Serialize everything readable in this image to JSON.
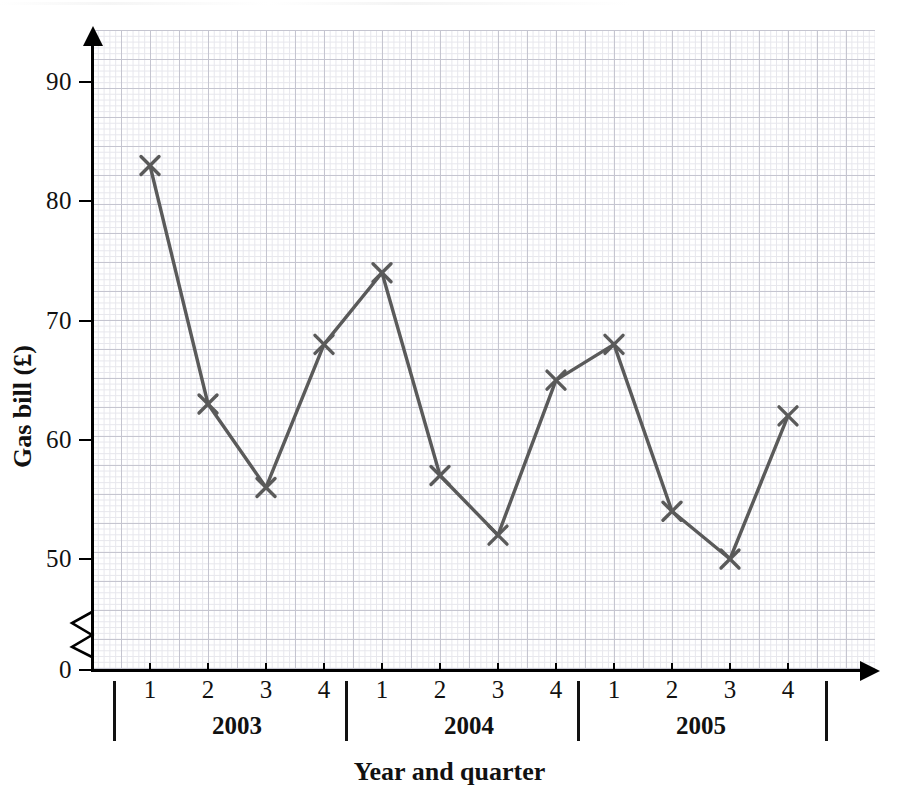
{
  "chart_data": {
    "type": "line",
    "title": "",
    "xlabel": "Year and quarter",
    "ylabel": "Gas bill (£)",
    "categories": [
      "2003 Q1",
      "2003 Q2",
      "2003 Q3",
      "2003 Q4",
      "2004 Q1",
      "2004 Q2",
      "2004 Q3",
      "2004 Q4",
      "2005 Q1",
      "2005 Q2",
      "2005 Q3",
      "2005 Q4"
    ],
    "values": [
      83,
      63,
      56,
      68,
      74,
      57,
      52,
      65,
      68,
      54,
      50,
      62
    ],
    "series": [
      {
        "name": "Gas bill",
        "values": [
          83,
          63,
          56,
          68,
          74,
          57,
          52,
          65,
          68,
          54,
          50,
          62
        ]
      }
    ],
    "groups": [
      {
        "year": "2003",
        "quarters": [
          "1",
          "2",
          "3",
          "4"
        ],
        "values": [
          83,
          63,
          56,
          68
        ]
      },
      {
        "year": "2004",
        "quarters": [
          "1",
          "2",
          "3",
          "4"
        ],
        "values": [
          74,
          57,
          52,
          65
        ]
      },
      {
        "year": "2005",
        "quarters": [
          "1",
          "2",
          "3",
          "4"
        ],
        "values": [
          68,
          54,
          50,
          62
        ]
      }
    ],
    "ylim": [
      0,
      95
    ],
    "yticks": [
      "0",
      "50",
      "60",
      "70",
      "80",
      "90"
    ],
    "ytick_values": [
      0,
      50,
      60,
      70,
      80,
      90
    ],
    "y_axis_break": true,
    "y_axis_break_between": [
      0,
      50
    ],
    "xtick_labels": [
      "1",
      "2",
      "3",
      "4",
      "1",
      "2",
      "3",
      "4",
      "1",
      "2",
      "3",
      "4"
    ],
    "grid": true,
    "grid_style": "graph-paper minor and major squares",
    "legend": "none",
    "marker": "x-cross",
    "line_color": "#5a5a5a",
    "marker_color": "#5a5a5a",
    "axis_color": "#000000",
    "grid_minor_color": "#e3e3ea",
    "grid_major_color": "#c4c4cf",
    "annotations": []
  },
  "axes": {
    "y_title": "Gas bill (£)",
    "x_title": "Year and quarter"
  },
  "yticks": [
    {
      "label": "90",
      "value": 90
    },
    {
      "label": "80",
      "value": 80
    },
    {
      "label": "70",
      "value": 70
    },
    {
      "label": "60",
      "value": 60
    },
    {
      "label": "50",
      "value": 50
    },
    {
      "label": "0",
      "value": 0
    }
  ],
  "xgroups": [
    {
      "year": "2003",
      "quarters": [
        "1",
        "2",
        "3",
        "4"
      ]
    },
    {
      "year": "2004",
      "quarters": [
        "1",
        "2",
        "3",
        "4"
      ]
    },
    {
      "year": "2005",
      "quarters": [
        "1",
        "2",
        "3",
        "4"
      ]
    }
  ]
}
